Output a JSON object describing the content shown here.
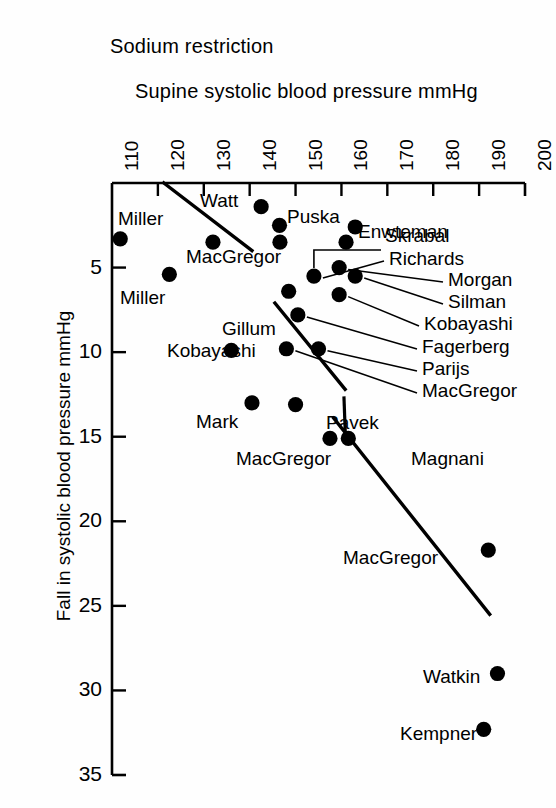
{
  "figure": {
    "supertitle": "Sodium restriction",
    "yaxis_title": "Fall in systolic blood pressure mmHg"
  },
  "chart_data": {
    "type": "scatter",
    "title": "Sodium restriction",
    "xlabel": "Supine systolic blood pressure mmHg",
    "ylabel": "Fall in systolic blood pressure mmHg",
    "xlim": [
      110,
      200
    ],
    "ylim": [
      0,
      35
    ],
    "y_inverted": true,
    "grid": false,
    "legend": "none",
    "xticks": [
      "110",
      "120",
      "130",
      "140",
      "150",
      "160",
      "170",
      "180",
      "190",
      "200"
    ],
    "yticks": [
      "5",
      "10",
      "15",
      "20",
      "25",
      "30",
      "35"
    ],
    "marker": "filled-circle",
    "marker_color": "#000000",
    "points": [
      {
        "label": "Miller",
        "x": 111.8,
        "y": 3.3,
        "label_pos": "above",
        "lx": 118,
        "ly": 208,
        "leader": false
      },
      {
        "label": "Watt",
        "x": 142.5,
        "y": 1.4,
        "label_pos": "left",
        "lx": 200,
        "ly": 190,
        "leader": false
      },
      {
        "label": "Puska",
        "x": 146.5,
        "y": 2.5,
        "label_pos": "right",
        "lx": 287,
        "ly": 206,
        "leader": false
      },
      {
        "label": "Skrabal",
        "x": 161.0,
        "y": 3.5,
        "label_pos": "right",
        "lx": 385,
        "ly": 225,
        "leader": false
      },
      {
        "label": "Skrabal",
        "x": 146.6,
        "y": 3.5,
        "label_pos": "right",
        "lx": 0,
        "ly": 0,
        "leader": false
      },
      {
        "label": "MacGregor",
        "x": 132.0,
        "y": 3.5,
        "label_pos": "below",
        "lx": 186,
        "ly": 246,
        "leader": false
      },
      {
        "label": "Enwteman",
        "x": 163.0,
        "y": 2.6,
        "label_pos": "right",
        "lx": 358,
        "ly": 221,
        "leader": false
      },
      {
        "label": "Miller",
        "x": 122.5,
        "y": 5.4,
        "label_pos": "below",
        "lx": 120,
        "ly": 287,
        "leader": false
      },
      {
        "label": "Richards",
        "x": 154.0,
        "y": 5.5,
        "label_pos": "leader-right",
        "lx": 389,
        "ly": 248,
        "leader": true
      },
      {
        "label": "Morgan",
        "x": 159.5,
        "y": 5.0,
        "label_pos": "leader-right",
        "lx": 448,
        "ly": 269,
        "leader": true
      },
      {
        "label": "Silman",
        "x": 163.0,
        "y": 5.5,
        "label_pos": "leader-right",
        "lx": 448,
        "ly": 291,
        "leader": true
      },
      {
        "label": "Kobayashi",
        "x": 159.5,
        "y": 6.6,
        "label_pos": "leader-right",
        "lx": 424,
        "ly": 313,
        "leader": true
      },
      {
        "label": "Gillum",
        "x": 148.5,
        "y": 6.4,
        "label_pos": "left",
        "lx": 222,
        "ly": 318,
        "leader": false
      },
      {
        "label": "Fagerberg",
        "x": 150.5,
        "y": 7.8,
        "label_pos": "leader-right",
        "lx": 422,
        "ly": 336,
        "leader": true
      },
      {
        "label": "Parijs",
        "x": 155.0,
        "y": 9.8,
        "label_pos": "leader-right",
        "lx": 422,
        "ly": 358,
        "leader": true
      },
      {
        "label": "MacGregor",
        "x": 148.0,
        "y": 9.8,
        "label_pos": "leader-right",
        "lx": 422,
        "ly": 380,
        "leader": true
      },
      {
        "label": "Kobayashi",
        "x": 136.0,
        "y": 9.9,
        "label_pos": "left",
        "lx": 167,
        "ly": 340,
        "leader": false
      },
      {
        "label": "Mark",
        "x": 140.5,
        "y": 13.0,
        "label_pos": "left",
        "lx": 196,
        "ly": 411,
        "leader": false
      },
      {
        "label": "Pavek",
        "x": 150.0,
        "y": 13.1,
        "label_pos": "right",
        "lx": 326,
        "ly": 412,
        "leader": false
      },
      {
        "label": "MacGregor",
        "x": 157.5,
        "y": 15.1,
        "label_pos": "left",
        "lx": 236,
        "ly": 448,
        "leader": false
      },
      {
        "label": "Magnani",
        "x": 161.5,
        "y": 15.1,
        "label_pos": "right",
        "lx": 411,
        "ly": 448,
        "leader": false
      },
      {
        "label": "MacGregor",
        "x": 192.0,
        "y": 21.7,
        "label_pos": "left",
        "lx": 343,
        "ly": 547,
        "leader": false
      },
      {
        "label": "Watkin",
        "x": 194.0,
        "y": 29.0,
        "label_pos": "left",
        "lx": 423,
        "ly": 666,
        "leader": false
      },
      {
        "label": "Kempner",
        "x": 191.0,
        "y": 32.3,
        "label_pos": "left",
        "lx": 400,
        "ly": 723,
        "leader": false
      }
    ],
    "trend_lines": [
      {
        "name": "upper-regression-line",
        "x1": 121.3,
        "y1": 0.0,
        "x2": 140.5,
        "y2": 4.0
      },
      {
        "name": "mid-regression-line",
        "x1": 145.5,
        "y1": 7.1,
        "x2": 160.8,
        "y2": 12.2
      },
      {
        "name": "lower-regression-line",
        "x1": 158.3,
        "y1": 13.9,
        "x2": 192.3,
        "y2": 25.5
      }
    ]
  },
  "plot_area": {
    "left": 112,
    "right": 525,
    "top": 183,
    "bottom": 775
  }
}
